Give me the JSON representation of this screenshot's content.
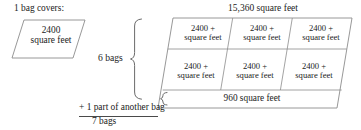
{
  "diagram": {
    "left": {
      "caption": "1 bag covers:",
      "box_line1": "2400",
      "box_line2": "square feet"
    },
    "middle": {
      "bags_label": "6 bags",
      "extra_line": "+ 1 part of another bag",
      "total_line": "7 bags"
    },
    "right": {
      "title": "15,360 square feet",
      "cells": [
        {
          "line1": "2400 +",
          "line2": "square feet"
        },
        {
          "line1": "2400 +",
          "line2": "square feet"
        },
        {
          "line1": "2400 +",
          "line2": "square feet"
        },
        {
          "line1": "2400 +",
          "line2": "square feet"
        },
        {
          "line1": "2400 +",
          "line2": "square feet"
        },
        {
          "line1": "2400 +",
          "line2": "square feet"
        }
      ],
      "strip_label": "960 square feet"
    }
  },
  "colors": {
    "stroke": "#8c8c8c",
    "text": "#1b1b1b",
    "rule": "#4a4a4a"
  }
}
